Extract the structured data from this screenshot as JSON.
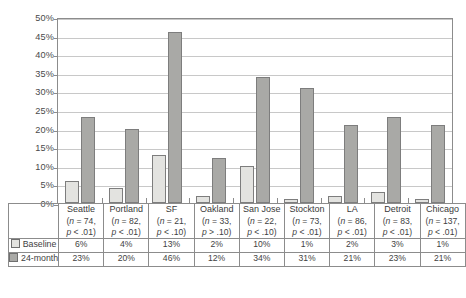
{
  "chart_data": {
    "type": "bar",
    "title": "",
    "xlabel": "",
    "ylabel": "",
    "ylim": [
      0,
      50
    ],
    "ytick_labels": [
      "50%",
      "45%",
      "40%",
      "35%",
      "30%",
      "25%",
      "20%",
      "15%",
      "10%",
      "5%",
      "0%"
    ],
    "ytick_values": [
      50,
      45,
      40,
      35,
      30,
      25,
      20,
      15,
      10,
      5,
      0
    ],
    "grid": true,
    "legend_position": "table-left",
    "categories": [
      "Seattle",
      "Portland",
      "SF",
      "Oakland",
      "San Jose",
      "Stockton",
      "LA",
      "Detroit",
      "Chicago"
    ],
    "series": [
      {
        "name": "Baseline",
        "color": "#e3e3e0",
        "values": [
          6,
          4,
          13,
          2,
          10,
          1,
          2,
          3,
          1
        ]
      },
      {
        "name": "24-month",
        "color": "#a9a9a6",
        "values": [
          23,
          20,
          46,
          12,
          34,
          31,
          21,
          23,
          21
        ]
      }
    ]
  },
  "axis": {
    "ticks": [
      {
        "label": "50%",
        "value": 50
      },
      {
        "label": "45%",
        "value": 45
      },
      {
        "label": "40%",
        "value": 40
      },
      {
        "label": "35%",
        "value": 35
      },
      {
        "label": "30%",
        "value": 30
      },
      {
        "label": "25%",
        "value": 25
      },
      {
        "label": "20%",
        "value": 20
      },
      {
        "label": "15%",
        "value": 15
      },
      {
        "label": "10%",
        "value": 10
      },
      {
        "label": "5%",
        "value": 5
      },
      {
        "label": "0%",
        "value": 0
      }
    ]
  },
  "table": {
    "columns": [
      {
        "name": "Seattle",
        "n": "(n = 74,",
        "p": "p < .01)"
      },
      {
        "name": "Portland",
        "n": "(n = 82,",
        "p": "p < .01)"
      },
      {
        "name": "SF",
        "n": "(n = 21,",
        "p": "p < .10)"
      },
      {
        "name": "Oakland",
        "n": "(n = 33,",
        "p": "p > .10)"
      },
      {
        "name": "San Jose",
        "n": "(n = 22,",
        "p": "p < .10)"
      },
      {
        "name": "Stockton",
        "n": "(n = 73,",
        "p": "p < .01)"
      },
      {
        "name": "LA",
        "n": "(n = 86,",
        "p": "p < .01)"
      },
      {
        "name": "Detroit",
        "n": "(n = 83,",
        "p": "p < .01)"
      },
      {
        "name": "Chicago",
        "n": "(n = 137,",
        "p": "p < .01)"
      }
    ],
    "rows": [
      {
        "label": "Baseline",
        "swatch": "baseline",
        "values": [
          "6%",
          "4%",
          "13%",
          "2%",
          "10%",
          "1%",
          "2%",
          "3%",
          "1%"
        ]
      },
      {
        "label": "24-month",
        "swatch": "month24",
        "values": [
          "23%",
          "20%",
          "46%",
          "12%",
          "34%",
          "31%",
          "21%",
          "23%",
          "21%"
        ]
      }
    ]
  },
  "colors": {
    "baseline": "#e3e3e0",
    "month24": "#a9a9a6",
    "axis": "#8c8c8c",
    "grid": "#c8c8c8",
    "text": "#3f3f3f"
  }
}
